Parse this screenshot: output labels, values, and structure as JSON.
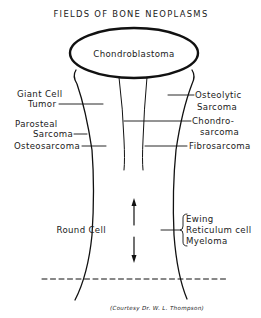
{
  "figure": {
    "title": "FIELDS OF BONE NEOPLASMS",
    "credit": "(Courtesy Dr. W. L. Thompson)",
    "colors": {
      "ink": "#111111",
      "background": "#ffffff"
    }
  },
  "regions": {
    "epiphysis": {
      "label": "Chondroblastoma"
    },
    "diaphysis": {
      "label": "Round Cell"
    }
  },
  "labels": {
    "left": {
      "giant_cell_line1": "Giant Cell",
      "giant_cell_line2": "Tumor",
      "parosteal_line1": "Parosteal",
      "parosteal_line2": "Sarcoma",
      "osteosarcoma": "Osteosarcoma"
    },
    "right": {
      "osteolytic_line1": "Osteolytic",
      "osteolytic_line2": "Sarcoma",
      "chondro_line1": "Chondro-",
      "chondro_line2": "sarcoma",
      "fibrosarcoma": "Fibrosarcoma"
    },
    "round_cell_types": {
      "ewing": "Ewing",
      "reticulum": "Reticulum cell",
      "myeloma": "Myeloma"
    }
  }
}
